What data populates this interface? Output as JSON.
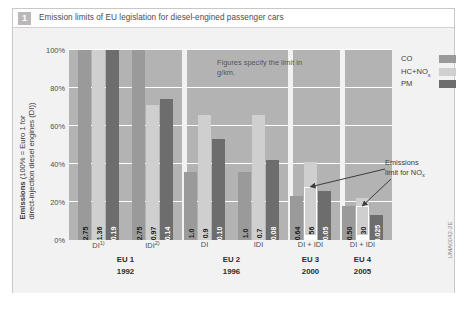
{
  "figure": {
    "number": "1",
    "title": "Emission limits of EU legislation for diesel-engined passenger cars",
    "source_code": "UMA0042-2E"
  },
  "note": "Figures specify the limit in g/km.",
  "annotation": {
    "line1": "Emissions",
    "line2_prefix": "limit for NO",
    "line2_sub": "x"
  },
  "legend": {
    "position": "top-right",
    "items": [
      {
        "label": "CO",
        "sub": "",
        "color": "#9a9a9a"
      },
      {
        "label": "HC+NO",
        "sub": "x",
        "color": "#cfcfcf"
      },
      {
        "label": "PM",
        "sub": "",
        "color": "#6d6d6d"
      }
    ]
  },
  "chart_data": {
    "type": "bar",
    "title": "Emission limits of EU legislation for diesel-engined passenger cars",
    "xlabel": "",
    "ylabel": "Emissions (100% = Euro 1 for direct-injection diesel engines (DI))",
    "ylim": [
      0,
      100
    ],
    "yticks": [
      "0%",
      "20%",
      "40%",
      "60%",
      "80%",
      "100%"
    ],
    "ytick_values": [
      0,
      20,
      40,
      60,
      80,
      100
    ],
    "grid": true,
    "unit_note": "Figures specify the limit in g/km.",
    "series": [
      {
        "name": "CO",
        "color": "#9a9a9a"
      },
      {
        "name": "HC+NOx",
        "color": "#cfcfcf"
      },
      {
        "name": "PM",
        "color": "#6d6d6d"
      }
    ],
    "groups": [
      {
        "standard": "EU 1",
        "year": "1992",
        "subgroups": [
          {
            "label": "DI",
            "footnote": "1)",
            "bars": [
              {
                "series": "CO",
                "limit": "2.75",
                "percent": 100
              },
              {
                "series": "HC+NOx",
                "limit": "1.36",
                "percent": 100
              },
              {
                "series": "PM",
                "limit": "0.19",
                "percent": 100
              }
            ]
          },
          {
            "label": "IDI",
            "footnote": "2)",
            "bars": [
              {
                "series": "CO",
                "limit": "2.75",
                "percent": 100
              },
              {
                "series": "HC+NOx",
                "limit": "0.97",
                "percent": 71
              },
              {
                "series": "PM",
                "limit": "0.14",
                "percent": 74
              }
            ]
          }
        ]
      },
      {
        "standard": "EU 2",
        "year": "1996",
        "subgroups": [
          {
            "label": "DI",
            "footnote": "",
            "bars": [
              {
                "series": "CO",
                "limit": "1.0",
                "percent": 36
              },
              {
                "series": "HC+NOx",
                "limit": "0.9",
                "percent": 66
              },
              {
                "series": "PM",
                "limit": "0.10",
                "percent": 53
              }
            ]
          },
          {
            "label": "IDI",
            "footnote": "",
            "bars": [
              {
                "series": "CO",
                "limit": "1.0",
                "percent": 36
              },
              {
                "series": "HC+NOx",
                "limit": "0.7",
                "percent": 66
              },
              {
                "series": "PM",
                "limit": "0.08",
                "percent": 42
              }
            ]
          }
        ]
      },
      {
        "standard": "EU 3",
        "year": "2000",
        "subgroups": [
          {
            "label": "DI + IDI",
            "footnote": "",
            "nox_limit_marker": {
              "percent": 28,
              "series": "HC+NOx"
            },
            "bars": [
              {
                "series": "CO",
                "limit": "0.64",
                "percent": 23
              },
              {
                "series": "HC+NOx",
                "limit": "0.56",
                "percent": 41
              },
              {
                "series": "PM",
                "limit": "0.05",
                "percent": 26
              }
            ]
          }
        ]
      },
      {
        "standard": "EU 4",
        "year": "2005",
        "subgroups": [
          {
            "label": "DI + IDI",
            "footnote": "",
            "nox_limit_marker": {
              "percent": 18,
              "series": "HC+NOx"
            },
            "bars": [
              {
                "series": "CO",
                "limit": "0.50",
                "percent": 18
              },
              {
                "series": "HC+NOx",
                "limit": "0.30",
                "percent": 22
              },
              {
                "series": "PM",
                "limit": "0.025",
                "percent": 13
              }
            ]
          }
        ]
      }
    ]
  }
}
